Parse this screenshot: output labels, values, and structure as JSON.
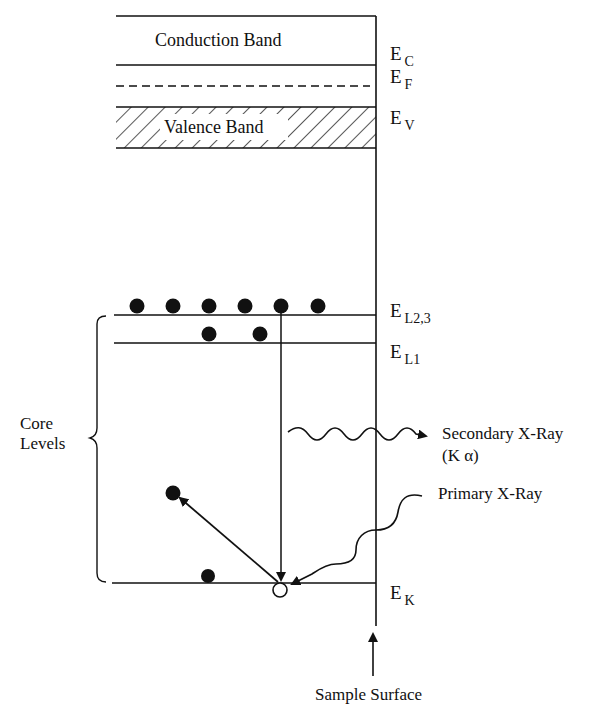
{
  "diagram": {
    "type": "energy-level diagram (X-ray fluorescence)",
    "bands": {
      "conduction": "Conduction Band",
      "valence": "Valence Band"
    },
    "levels": [
      {
        "id": "EC",
        "symbol": "E",
        "sub": "C",
        "style": "solid"
      },
      {
        "id": "EF",
        "symbol": "E",
        "sub": "F",
        "style": "dashed"
      },
      {
        "id": "EV",
        "symbol": "E",
        "sub": "V",
        "style": "hatched-band-top"
      },
      {
        "id": "EL23",
        "symbol": "E",
        "sub": "L2,3",
        "style": "solid",
        "electrons": 6
      },
      {
        "id": "EL1",
        "symbol": "E",
        "sub": "L1",
        "style": "solid",
        "electrons": 2
      },
      {
        "id": "EK",
        "symbol": "E",
        "sub": "K",
        "style": "solid",
        "electrons": 1,
        "holes": 1
      }
    ],
    "labels": {
      "core_levels_line1": "Core",
      "core_levels_line2": "Levels",
      "secondary_xray_line1": "Secondary X-Ray",
      "secondary_xray_line2": "(K α)",
      "primary_xray": "Primary X-Ray",
      "sample_surface": "Sample Surface"
    },
    "colors": {
      "ink": "#111111",
      "background": "#ffffff"
    }
  }
}
